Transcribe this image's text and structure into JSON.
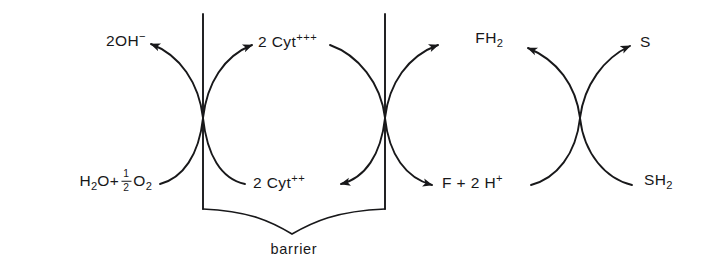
{
  "diagram": {
    "stroke_color": "#18181a",
    "background_color": "#ffffff",
    "labels": {
      "hydroxide": "2OH",
      "hydroxide_charge": "−",
      "water_oxygen_prefix": "H",
      "water_oxygen": "H2O+ 1/2 O2",
      "cyt_ox": "2 Cyt",
      "cyt_ox_charge": "+++",
      "cyt_red": "2 Cyt",
      "cyt_red_charge": "++",
      "flavin_reduced": "FH",
      "flavin_reduced_sub": "2",
      "flavin_oxidized": "F + 2 H",
      "flavin_oxidized_charge": "+",
      "substrate_ox": "S",
      "substrate_red": "SH",
      "substrate_red_sub": "2",
      "barrier": "barrier"
    },
    "formulas": {
      "water_half_oxygen": {
        "lead": "H",
        "lead_sub": "2",
        "mid": "O+",
        "frac_num": "1",
        "frac_den": "2",
        "tail": "O",
        "tail_sub": "2"
      }
    },
    "nodes": [
      {
        "name": "crossing-1",
        "x": 203,
        "y": 118
      },
      {
        "name": "crossing-2",
        "x": 385,
        "y": 118
      },
      {
        "name": "crossing-3",
        "x": 580,
        "y": 118
      }
    ],
    "barriers": [
      {
        "name": "barrier-line-left",
        "x": 203,
        "y_top": 14,
        "y_bottom": 209
      },
      {
        "name": "barrier-line-right",
        "x": 385,
        "y_top": 14,
        "y_bottom": 209
      }
    ]
  }
}
